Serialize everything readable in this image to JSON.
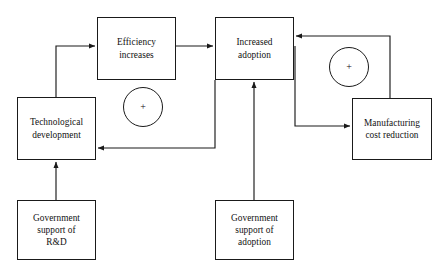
{
  "diagram": {
    "type": "causal-loop-diagram",
    "nodes": [
      {
        "id": "efficiency",
        "label": "Efficiency\nincreases",
        "x": 97,
        "y": 17,
        "w": 79,
        "h": 63
      },
      {
        "id": "increased-adoption",
        "label": "Increased\nadoption",
        "x": 215,
        "y": 17,
        "w": 79,
        "h": 63
      },
      {
        "id": "technological-development",
        "label": "Technological\ndevelopment",
        "x": 17,
        "y": 97,
        "w": 79,
        "h": 63
      },
      {
        "id": "manufacturing-cost-reduction",
        "label": "Manufacturing\ncost reduction",
        "x": 352,
        "y": 98,
        "w": 80,
        "h": 62
      },
      {
        "id": "government-support-rd",
        "label": "Government\nsupport of\nR&D",
        "x": 17,
        "y": 200,
        "w": 79,
        "h": 60
      },
      {
        "id": "government-support-adoption",
        "label": "Government\nsupport of\nadoption",
        "x": 215,
        "y": 200,
        "w": 79,
        "h": 60
      }
    ],
    "polarity_markers": [
      {
        "id": "left-loop-plus",
        "symbol": "+",
        "cx": 143,
        "cy": 107
      },
      {
        "id": "right-loop-plus",
        "symbol": "+",
        "cx": 349,
        "cy": 67
      }
    ],
    "edges": [
      {
        "id": "technological-development-to-efficiency",
        "from": "technological-development",
        "to": "efficiency",
        "polarity": "+"
      },
      {
        "id": "efficiency-to-increased-adoption",
        "from": "efficiency",
        "to": "increased-adoption",
        "polarity": "+"
      },
      {
        "id": "increased-adoption-to-technological-development",
        "from": "increased-adoption",
        "to": "technological-development",
        "polarity": "+"
      },
      {
        "id": "increased-adoption-to-manufacturing-cost-reduction",
        "from": "increased-adoption",
        "to": "manufacturing-cost-reduction",
        "polarity": "+"
      },
      {
        "id": "manufacturing-cost-reduction-to-increased-adoption",
        "from": "manufacturing-cost-reduction",
        "to": "increased-adoption",
        "polarity": "+"
      },
      {
        "id": "government-support-rd-to-technological-development",
        "from": "government-support-rd",
        "to": "technological-development",
        "polarity": "+"
      },
      {
        "id": "government-support-adoption-to-increased-adoption",
        "from": "government-support-adoption",
        "to": "increased-adoption",
        "polarity": "+"
      }
    ],
    "colors": {
      "stroke": "#1a1a1a",
      "text": "#111111",
      "background": "#ffffff"
    }
  }
}
